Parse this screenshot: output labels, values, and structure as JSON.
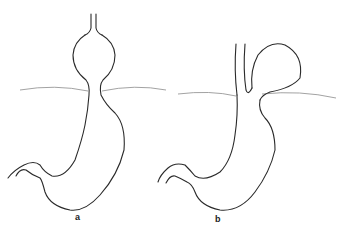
{
  "figure": {
    "panels": [
      {
        "id": "a",
        "label": "a",
        "description": "Sliding (axial) hiatal hernia — gastric fundus herniated above diaphragm in line with esophagus"
      },
      {
        "id": "b",
        "label": "b",
        "description": "Paraesophageal (rolling) hiatal hernia — fundus herniated alongside esophagus above diaphragm"
      }
    ],
    "colors": {
      "line": "#2a2a2a",
      "diaphragm": "#8a8a8a",
      "background": "#ffffff"
    }
  }
}
